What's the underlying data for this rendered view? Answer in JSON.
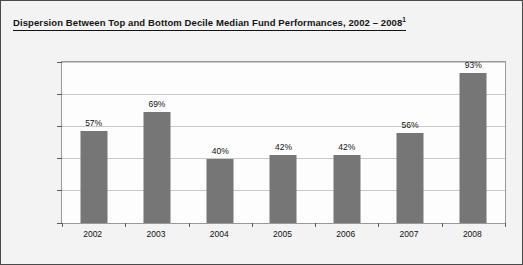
{
  "chart_data": {
    "type": "bar",
    "title": "Dispersion Between Top and Bottom Decile Median Fund Performances, 2002 – 2008",
    "title_superscript": "1",
    "categories": [
      "2002",
      "2003",
      "2004",
      "2005",
      "2006",
      "2007",
      "2008"
    ],
    "values": [
      57,
      69,
      40,
      42,
      42,
      56,
      93
    ],
    "value_labels": [
      "57%",
      "69%",
      "40%",
      "42%",
      "42%",
      "56%",
      "93%"
    ],
    "xlabel": "",
    "ylabel": "",
    "ylim": [
      0,
      100
    ],
    "y_ticks": [
      0,
      20,
      40,
      60,
      80,
      100
    ],
    "y_tick_labels": [
      "0%",
      "20%",
      "40%",
      "60%",
      "80%",
      "100%"
    ],
    "grid": true,
    "legend": false,
    "series_color": "#767676",
    "gridline_color": "#c9c9c9",
    "plot_border_color": "#9a9a9a",
    "text_color": "#111111",
    "background_color": "#f3f3f3",
    "plot_background_color": "#fdfdfd"
  }
}
